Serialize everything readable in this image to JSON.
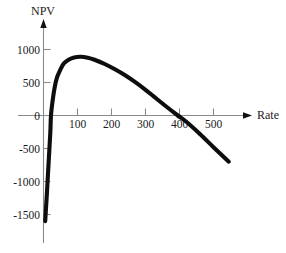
{
  "chart_data": {
    "type": "line",
    "title": "",
    "xlabel": "Rate",
    "ylabel": "NPV",
    "xlim": [
      -40,
      560
    ],
    "ylim": [
      -1750,
      1250
    ],
    "grid": false,
    "legend": null,
    "x_ticks": [
      100,
      200,
      300,
      400,
      500
    ],
    "x_tick_labels": [
      "100",
      "200",
      "300",
      "400",
      "500"
    ],
    "y_ticks": [
      1000,
      500,
      0,
      -500,
      -1000,
      -1500
    ],
    "y_tick_labels": [
      "1000",
      "500",
      "0",
      "-500",
      "-1000",
      "-1500"
    ],
    "series": [
      {
        "name": "NPV",
        "points": [
          [
            5,
            -1600
          ],
          [
            10,
            -1180
          ],
          [
            15,
            -720
          ],
          [
            20,
            -260
          ],
          [
            22,
            0
          ],
          [
            27,
            230
          ],
          [
            33,
            430
          ],
          [
            40,
            580
          ],
          [
            50,
            700
          ],
          [
            60,
            790
          ],
          [
            75,
            850
          ],
          [
            90,
            880
          ],
          [
            110,
            890
          ],
          [
            130,
            875
          ],
          [
            150,
            845
          ],
          [
            180,
            780
          ],
          [
            210,
            700
          ],
          [
            240,
            610
          ],
          [
            270,
            505
          ],
          [
            300,
            390
          ],
          [
            330,
            265
          ],
          [
            360,
            140
          ],
          [
            395,
            0
          ],
          [
            420,
            -95
          ],
          [
            460,
            -280
          ],
          [
            500,
            -480
          ],
          [
            545,
            -700
          ]
        ]
      }
    ],
    "annotations": {
      "zero_crossings": [
        22,
        395
      ],
      "maximum": {
        "x": 110,
        "y": 890
      },
      "start": {
        "x": 5,
        "y": -1600
      },
      "end": {
        "x": 545,
        "y": -700
      }
    }
  },
  "axes": {
    "y_axis_title": "NPV",
    "x_axis_title": "Rate"
  },
  "colors": {
    "curve": "#0d0d0d",
    "axis": "#8a8a8a",
    "text": "#1a1a1a",
    "background": "#ffffff"
  }
}
